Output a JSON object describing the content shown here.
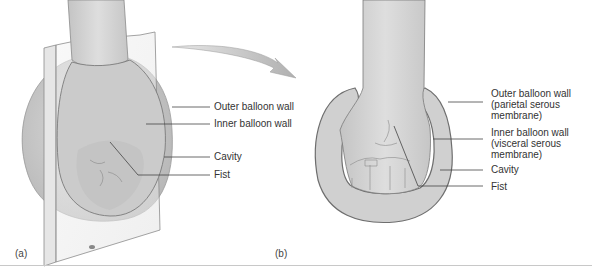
{
  "figure": {
    "panels": [
      {
        "id": "a",
        "label": "(a)",
        "description": "Fist pushed into a balloon, shown as a cutaway behind a glass plate",
        "callouts": [
          {
            "text": "Outer balloon wall"
          },
          {
            "text": "Inner balloon wall"
          },
          {
            "text": "Cavity"
          },
          {
            "text": "Fist"
          }
        ]
      },
      {
        "id": "b",
        "label": "(b)",
        "description": "Cross-section of fist surrounded by inner and outer balloon walls",
        "callouts": [
          {
            "text": "Outer balloon wall\n(parietal serous\nmembrane)"
          },
          {
            "text": "Inner balloon wall\n(visceral serous\nmembrane)"
          },
          {
            "text": "Cavity"
          },
          {
            "text": "Fist"
          }
        ]
      }
    ],
    "arrow": "curved-arrow from panel a to panel b",
    "colors": {
      "balloon_fill": "#d2d2d2",
      "balloon_shade": "#bdbdbd",
      "outline": "#7a7a7a",
      "leader_line": "#444444",
      "text": "#333333"
    }
  }
}
